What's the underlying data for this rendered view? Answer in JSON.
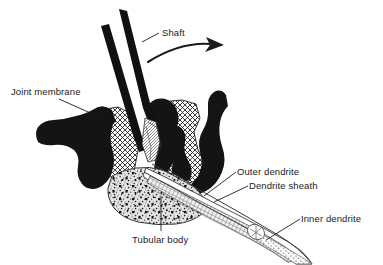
{
  "figure": {
    "background_color": "#ffffff",
    "ink_color": "#1b1b1b",
    "width": 383,
    "height": 265
  },
  "labels": [
    {
      "id": "shaft",
      "text": "Shaft",
      "x": 162,
      "y": 27,
      "leader": "line from text down-left to upper hair shaft"
    },
    {
      "id": "joint-membrane",
      "text": "Joint membrane",
      "x": 11,
      "y": 86,
      "leader": "line from text down-right to membrane fold at left"
    },
    {
      "id": "outer-dendrite",
      "text": "Outer dendrite",
      "x": 237,
      "y": 166,
      "leader": "line from text down-left to striated dendrite tube"
    },
    {
      "id": "dendrite-sheath",
      "text": "Dendrite sheath",
      "x": 249,
      "y": 180,
      "leader": "line from text down-left to sheath wall"
    },
    {
      "id": "inner-dendrite",
      "text": "Inner dendrite",
      "x": 301,
      "y": 213,
      "leader": "line from text down-left to stippled distal tip"
    },
    {
      "id": "tubular-body",
      "text": "Tubular body",
      "x": 132,
      "y": 234,
      "leader": "vertical line from text up to stippled tubular body mass"
    }
  ],
  "annotations": {
    "motion_arrow": {
      "name": "rotation-arrow",
      "description": "curved arrow indicating shaft deflection to the right"
    }
  },
  "structures": [
    {
      "id": "shaft-upper",
      "name": "Shaft",
      "fill": "solid-black"
    },
    {
      "id": "shaft-lower",
      "name": "Shaft",
      "fill": "solid-black"
    },
    {
      "id": "joint-membrane-left",
      "name": "Joint membrane",
      "fill": "solid-black"
    },
    {
      "id": "joint-membrane-right",
      "name": "Joint membrane",
      "fill": "solid-black"
    },
    {
      "id": "cuticle-left",
      "name": "Cuticle",
      "fill": "cross-hatch"
    },
    {
      "id": "cuticle-right",
      "name": "Cuticle",
      "fill": "cross-hatch"
    },
    {
      "id": "tubular-body",
      "name": "Tubular body",
      "fill": "stipple"
    },
    {
      "id": "outer-dendrite",
      "name": "Outer dendrite",
      "fill": "striated"
    },
    {
      "id": "dendrite-sheath",
      "name": "Dendrite sheath",
      "fill": "outline"
    },
    {
      "id": "inner-dendrite",
      "name": "Inner dendrite",
      "fill": "stipple"
    }
  ]
}
